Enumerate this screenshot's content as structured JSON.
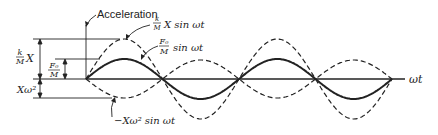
{
  "labels": {
    "acceleration": "Acceleration",
    "omega_t": "ωt",
    "kM_X_left": {
      "num": "k",
      "den": "M",
      "rest": "X"
    },
    "F0_M_left": {
      "num": "F₀",
      "den": "M"
    },
    "X_omega2_left": "Xω²",
    "curve_displacement": {
      "num": "k",
      "den": "M",
      "rest": "X sin ωt"
    },
    "curve_force": {
      "num": "F₀",
      "den": "M",
      "rest": "sin ωt"
    },
    "curve_acceleration": "−Xω² sin ωt"
  },
  "colors": {
    "ink": "#222222",
    "background": "#ffffff"
  },
  "chart_data": {
    "type": "line",
    "title": "",
    "xlabel": "ωt",
    "ylabel": "",
    "x_zero_crossings_px": [
      86,
      162.5,
      239,
      315.5,
      392
    ],
    "axis_y_px": 79,
    "series": [
      {
        "name": "(k/M) X sin ωt",
        "style": "dashed",
        "amplitude_px": 40,
        "sign": 1
      },
      {
        "name": "(F₀/M) sin ωt",
        "style": "solid-bold",
        "amplitude_px": 20,
        "sign": 1
      },
      {
        "name": "−Xω² sin ωt",
        "style": "dashed",
        "amplitude_px": 19,
        "sign": -1
      }
    ],
    "dimensions": [
      {
        "label": "(k/M) X",
        "from_px": 39,
        "to_px": 79
      },
      {
        "label": "F₀/M",
        "from_px": 59,
        "to_px": 79
      },
      {
        "label": "Xω²",
        "from_px": 79,
        "to_px": 98
      }
    ]
  }
}
